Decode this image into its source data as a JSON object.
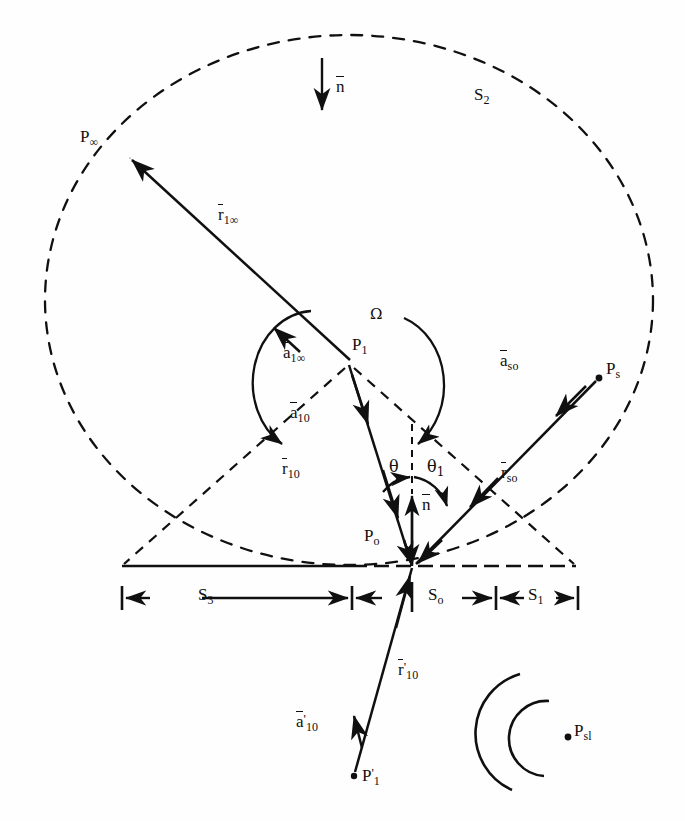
{
  "figure": {
    "kind": "technical-line-diagram",
    "background_color": "#fefefe",
    "ink_color": "#101010"
  },
  "surfaces": {
    "outer_dashed_label": "S",
    "outer_dashed_sub": "2",
    "baseline_segments": [
      {
        "name": "S3",
        "base": "S",
        "sub": "3"
      },
      {
        "name": "S0",
        "base": "S",
        "sub": "o"
      },
      {
        "name": "S1",
        "base": "S",
        "sub": "1"
      }
    ]
  },
  "points": {
    "p_infinity": {
      "base": "P",
      "sub": "∞"
    },
    "p_one": {
      "base": "P",
      "sub": "1"
    },
    "p_one_prime": {
      "base": "P",
      "prime": "'",
      "sub": "1"
    },
    "p_zero": {
      "base": "P",
      "sub": "o"
    },
    "p_source": {
      "base": "P",
      "sub": "s"
    },
    "p_source_l": {
      "base": "P",
      "sub": "sl"
    }
  },
  "vectors": {
    "r_1_infinity": {
      "base": "r",
      "overbar": true,
      "sub": "1∞"
    },
    "a_1_infinity": {
      "base": "a",
      "overbar": true,
      "sub": "1∞"
    },
    "a_10": {
      "base": "a",
      "overbar": true,
      "sub": "10"
    },
    "r_10": {
      "base": "r",
      "overbar": true,
      "sub": "10"
    },
    "r_10_prime": {
      "base": "r",
      "overbar": true,
      "prime": "'",
      "sub": "10"
    },
    "a_10_prime": {
      "base": "a",
      "overbar": true,
      "prime": "'",
      "sub": "10"
    },
    "a_so": {
      "base": "a",
      "overbar": true,
      "sub": "so"
    },
    "r_so": {
      "base": "r",
      "overbar": true,
      "sub": "so"
    },
    "n_top": {
      "base": "n",
      "overbar": true
    },
    "n_mid": {
      "base": "n",
      "overbar": true
    }
  },
  "angles": {
    "theta": {
      "glyph": "θ"
    },
    "theta_1": {
      "glyph": "θ",
      "sub": "1"
    },
    "omega": {
      "glyph": "Ω"
    }
  },
  "geometry": {
    "outer_circle": {
      "cx": 349,
      "cy": 300,
      "rx": 304,
      "ry": 265
    },
    "baseline": {
      "x1": 122,
      "x2": 576,
      "y": 566
    },
    "dimension_line_y": 597,
    "p1": {
      "x": 349,
      "y": 362
    },
    "p0": {
      "x": 412,
      "y": 566
    },
    "p1_prime": {
      "x": 354,
      "y": 776
    },
    "p_inf": {
      "x": 128,
      "y": 156
    },
    "p_s": {
      "x": 599,
      "y": 378
    },
    "p_sl": {
      "x": 568,
      "y": 737
    }
  }
}
